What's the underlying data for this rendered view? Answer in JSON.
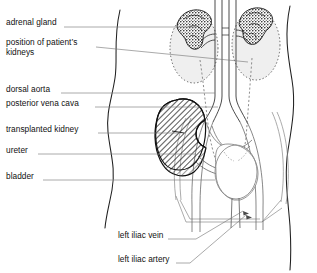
{
  "diagram": {
    "style": "black-and-white line drawing",
    "colors": {
      "background": "#ffffff",
      "ink": "#111111",
      "leader_line": "#6e6e6e",
      "organ_outline": "#555555",
      "native_kidney_fill": "#efefef",
      "native_kidney_outline_style": "dotted",
      "transplant_hatch": "#1a1a1a",
      "adrenal_texture": "#1a1a1a"
    }
  },
  "labels": {
    "left": [
      {
        "id": "adrenal-gland",
        "text": "adrenal gland",
        "x": 6,
        "y": 18,
        "leader_y": 28,
        "leader_to_x": 196
      },
      {
        "id": "position-of-kidneys",
        "text": "position of patient’s",
        "text2": "kidneys",
        "x": 6,
        "y": 43,
        "leader_y": 50,
        "leader_to_x": 248
      },
      {
        "id": "dorsal-aorta",
        "text": "dorsal aorta",
        "x": 6,
        "y": 85,
        "leader_y": 93,
        "leader_to_x": 215
      },
      {
        "id": "posterior-vena-cava",
        "text": "posterior vena cava",
        "x": 6,
        "y": 100,
        "leader_y": 108,
        "leader_to_x": 218
      },
      {
        "id": "transplanted-kidney",
        "text": "transplanted kidney",
        "x": 6,
        "y": 125,
        "leader_y": 133,
        "leader_to_x": 180
      },
      {
        "id": "ureter",
        "text": "ureter",
        "x": 6,
        "y": 147,
        "leader_y": 155,
        "leader_to_x": 196
      },
      {
        "id": "bladder",
        "text": "bladder",
        "x": 6,
        "y": 172,
        "leader_y": 180,
        "leader_to_x": 215
      }
    ],
    "bottom": [
      {
        "id": "left-iliac-vein",
        "text": "left iliac vein",
        "x": 118,
        "y": 232,
        "leader_y": 240,
        "leader_to_x": 196,
        "arrow_x": 243,
        "arrow_y": 212
      },
      {
        "id": "left-iliac-artery",
        "text": "left iliac artery",
        "x": 118,
        "y": 256,
        "leader_y": 264,
        "leader_to_x": 190,
        "arrow_x": 246,
        "arrow_y": 216
      }
    ]
  },
  "structures": [
    {
      "id": "body-outline-left",
      "name": "left torso silhouette",
      "kind": "wavy-line"
    },
    {
      "id": "body-outline-right",
      "name": "right torso silhouette",
      "kind": "wavy-line"
    },
    {
      "id": "native-kidney-left",
      "name": "patient's left kidney (native)",
      "kind": "dotted-oval"
    },
    {
      "id": "native-kidney-right",
      "name": "patient's right kidney (native)",
      "kind": "dotted-oval"
    },
    {
      "id": "adrenal-gland-left",
      "name": "left adrenal gland",
      "kind": "textured-blob"
    },
    {
      "id": "adrenal-gland-right",
      "name": "right adrenal gland",
      "kind": "textured-blob"
    },
    {
      "id": "dorsal-aorta",
      "name": "dorsal aorta",
      "kind": "vessel"
    },
    {
      "id": "posterior-vena-cava",
      "name": "posterior vena cava",
      "kind": "vessel"
    },
    {
      "id": "transplanted-kidney",
      "name": "transplanted kidney in left iliac fossa",
      "kind": "hatched-bean"
    },
    {
      "id": "ureter-native-left",
      "name": "native left ureter",
      "kind": "dotted-tube"
    },
    {
      "id": "ureter-native-right",
      "name": "native right ureter",
      "kind": "dotted-tube"
    },
    {
      "id": "ureter-transplant",
      "name": "transplant ureter to bladder",
      "kind": "tube"
    },
    {
      "id": "bladder",
      "name": "urinary bladder",
      "kind": "rounded-organ"
    },
    {
      "id": "urethra",
      "name": "urethra",
      "kind": "tube"
    },
    {
      "id": "left-iliac-vein",
      "name": "left iliac vein",
      "kind": "vessel"
    },
    {
      "id": "left-iliac-artery",
      "name": "left iliac artery",
      "kind": "vessel"
    },
    {
      "id": "pelvic-brim",
      "name": "pelvic brim outline",
      "kind": "line"
    }
  ]
}
